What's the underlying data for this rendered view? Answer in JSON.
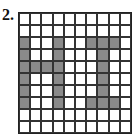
{
  "problem": {
    "number_label": "2.",
    "grid": {
      "rows": 10,
      "cols": 10,
      "fill_color": "#8a8a8a",
      "empty_color": "#ffffff",
      "line_color": "#333333",
      "cells": [
        [
          0,
          0,
          0,
          0,
          0,
          0,
          0,
          0,
          0,
          0
        ],
        [
          0,
          0,
          0,
          0,
          0,
          0,
          0,
          0,
          0,
          0
        ],
        [
          1,
          0,
          0,
          1,
          0,
          0,
          1,
          1,
          1,
          0
        ],
        [
          1,
          0,
          0,
          1,
          0,
          0,
          0,
          1,
          0,
          0
        ],
        [
          1,
          1,
          1,
          1,
          0,
          0,
          0,
          1,
          0,
          0
        ],
        [
          1,
          0,
          0,
          1,
          0,
          0,
          0,
          1,
          0,
          0
        ],
        [
          1,
          0,
          0,
          1,
          0,
          0,
          0,
          1,
          0,
          0
        ],
        [
          1,
          0,
          0,
          1,
          0,
          0,
          1,
          1,
          1,
          0
        ],
        [
          0,
          0,
          0,
          0,
          0,
          0,
          0,
          0,
          0,
          0
        ],
        [
          0,
          0,
          0,
          0,
          0,
          0,
          0,
          0,
          0,
          0
        ]
      ]
    }
  }
}
